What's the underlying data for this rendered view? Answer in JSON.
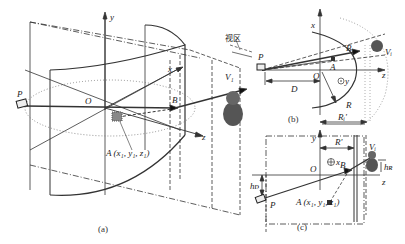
{
  "figure": {
    "panel_a": {
      "caption": "(a)",
      "axis_y": "y",
      "axis_x": "x",
      "axis_z": "z",
      "origin": "O",
      "point_p": "P",
      "point_b": "B",
      "point_a": "A (x₁, y₁, z₁)",
      "viewer": "V₁",
      "view_zone": "视区"
    },
    "panel_b": {
      "caption": "(b)",
      "axis_x": "x",
      "axis_z": "z",
      "axis_y": "⊙y",
      "origin": "O",
      "point_p": "P",
      "point_b": "B",
      "point_a": "A",
      "viewer": "Vᵢ",
      "distance": "D",
      "radius": "R",
      "radius_prime": "Rᵢ'"
    },
    "panel_c": {
      "caption": "(c)",
      "axis_y": "y",
      "axis_z": "z",
      "axis_x": "⊕x",
      "origin": "O",
      "point_p": "P",
      "point_b": "B",
      "point_a": "A (x₁, y₁, z₁)",
      "viewer": "Vᵢ",
      "radius_prime": "R'",
      "radius_i": "Rᵢ'",
      "height_d": "hᴅ",
      "height_r": "hʀ"
    }
  }
}
